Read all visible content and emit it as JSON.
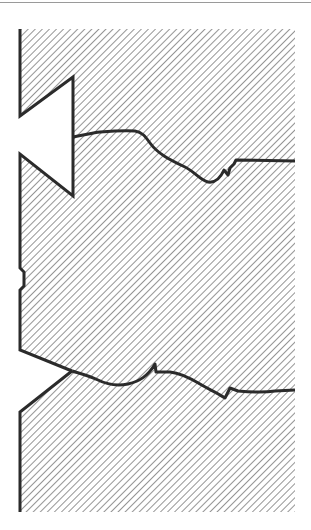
{
  "diagram": {
    "type": "cross-section",
    "colors": {
      "background": "#ffffff",
      "hatch": "#7a7a7a",
      "outline": "#2b2b2b",
      "top_rule": "#9a9a9a"
    },
    "region": {
      "x": 20,
      "y": 29,
      "width": 275,
      "height": 483
    },
    "hatch_spacing": 5,
    "elements": [
      {
        "name": "upper-notch",
        "kind": "open triangular notch"
      },
      {
        "name": "upper-crack",
        "kind": "fracture line"
      },
      {
        "name": "side-nick",
        "kind": "small edge notch"
      },
      {
        "name": "lower-bevel",
        "kind": "chamfered edge"
      },
      {
        "name": "lower-crack",
        "kind": "fracture line"
      }
    ]
  }
}
